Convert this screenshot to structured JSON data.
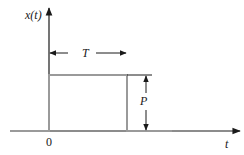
{
  "diagram": {
    "type": "rectangular-pulse",
    "y_axis_label": "x(t)",
    "x_axis_label": "t",
    "origin_label": "0",
    "width_label": "T",
    "height_label": "P",
    "colors": {
      "axes": "#1a1a1a",
      "pulse": "#9a9a9a",
      "annotation": "#1a1a1a"
    }
  }
}
